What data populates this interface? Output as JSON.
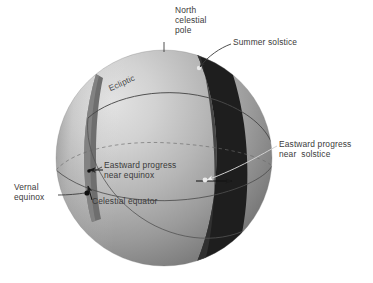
{
  "figure": {
    "background_color": "#ffffff",
    "text_color": "#3a3a3a"
  },
  "sphere": {
    "center_x": 164,
    "center_y": 158,
    "radius": 108,
    "light_color": "#d8d8d8",
    "mid_color": "#a8a8a8",
    "shadow_color": "#6f6f6f",
    "highlight_x": 112,
    "highlight_y": 104
  },
  "bands": {
    "equinox_band": {
      "name": "eastward-progress-near-equinox-band",
      "fill_color": "#6a6a6a",
      "description": "Narrow lune near the vernal equinox on the left limb"
    },
    "solstice_band": {
      "name": "eastward-progress-near-solstice-band",
      "fill_color": "#1c1c1c",
      "description": "Wide dark lune at the summer solstice on the right"
    }
  },
  "curves": {
    "ecliptic": {
      "name": "ecliptic-great-circle",
      "color": "#555555"
    },
    "celestial_equator": {
      "name": "celestial-equator-great-circle",
      "color": "#555555"
    }
  },
  "markers": {
    "vernal_equinox_point": {
      "color": "#111111"
    },
    "solstice_point": {
      "color": "#e8e8e8"
    }
  },
  "labels": {
    "north_celestial_pole": "North\ncelestial\npole",
    "summer_solstice": "Summer solstice",
    "eastward_progress_near_solstice": "Eastward progress\nnear  solstice",
    "eastward_progress_near_equinox": "Eastward progress\nnear equinox",
    "vernal_equinox": "Vernal\nequinox",
    "celestial_equator": "Celestial equator",
    "ecliptic": "Ecliptic"
  }
}
